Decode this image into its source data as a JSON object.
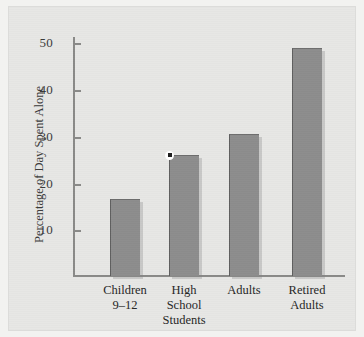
{
  "figure": {
    "background_color": "#e7e7e5",
    "page_color": "#f2f2f0"
  },
  "chart_data": {
    "type": "bar",
    "title": "",
    "xlabel": "",
    "ylabel": "Percentage of Day Spent Alone",
    "categories": [
      "Children 9–12",
      "High School Students",
      "Adults",
      "Retired Adults"
    ],
    "category_lines": [
      [
        "Children",
        "9–12"
      ],
      [
        "High",
        "School",
        "Students"
      ],
      [
        "Adults"
      ],
      [
        "Retired",
        "Adults"
      ]
    ],
    "values": [
      16.5,
      26,
      30.5,
      49
    ],
    "ylim": [
      0,
      52
    ],
    "yticks": [
      10,
      20,
      30,
      40,
      50
    ],
    "ytick_labels": [
      "10",
      "20",
      "30",
      "40",
      "50"
    ],
    "grid": false,
    "legend": null,
    "bar_color": "#8d8d8d",
    "axis_color": "#8a8a88",
    "annotations": [
      {
        "name": "data-point-marker",
        "category": "High School Students",
        "value": 26,
        "shape": "square-dot-with-white-halo"
      }
    ]
  }
}
